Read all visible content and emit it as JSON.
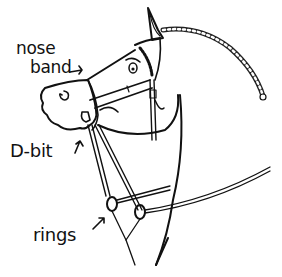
{
  "illustration": {
    "subject": "horse head with bridle",
    "labels": {
      "nose": "nose",
      "band": "band",
      "dbit": "D-bit",
      "rings": "rings"
    },
    "arrows": [
      "nose-band-arrow",
      "d-bit-arrow",
      "rings-arrow"
    ],
    "colors": {
      "ink": "#111111",
      "background": "#ffffff"
    }
  }
}
